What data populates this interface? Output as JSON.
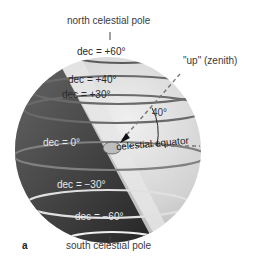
{
  "diagram": {
    "panel_label": "a",
    "poles": {
      "north": "north celestial pole",
      "south": "south celestial pole"
    },
    "zenith_label": "\"up\" (zenith)",
    "angle_label": "40°",
    "equator_label": "celestial equator",
    "declination_circles": [
      {
        "label": "dec = +60°"
      },
      {
        "label": "dec = +40°"
      },
      {
        "label": "dec = +30°"
      },
      {
        "label": "dec = 0°"
      },
      {
        "label": "dec = −30°"
      },
      {
        "label": "dec = −60°"
      }
    ],
    "colors": {
      "sphere_light": "#d8d8d8",
      "sphere_dark": "#3a3a3a",
      "circle_light": "#6e6e6e",
      "circle_dark": "#f0f0f0",
      "band": "#e9e9e9"
    }
  }
}
